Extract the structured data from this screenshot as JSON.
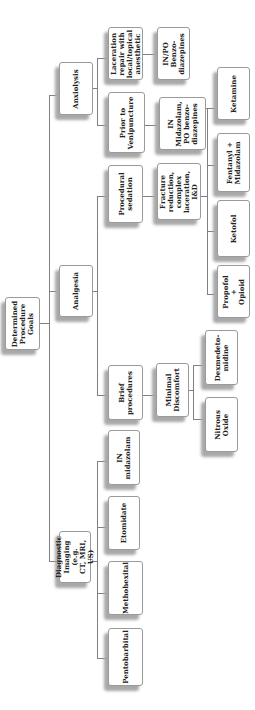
{
  "diagram": {
    "orientation": "rotated-90-counterclockwise",
    "root": {
      "label": "Determined\nProcedure\nGoals"
    },
    "goals": [
      {
        "label": "Anxiolysis",
        "situations": [
          {
            "label": "Laceration\nrepair with\nlocal/topical\nanesthetic",
            "options": [
              {
                "label": "IN/PO Benzo-\ndiazepines"
              }
            ]
          },
          {
            "label": "Prior to\nVenipuncture",
            "options": [
              {
                "label": "IN\nMidazolam,\nPO benzo-\ndiazepines"
              }
            ]
          }
        ]
      },
      {
        "label": "Analgesia",
        "situations": [
          {
            "label": "Procedural\nsedation",
            "options": [
              {
                "label": "Fracture\nreduction,\ncomplex\nlaceration,\nI&D",
                "agents": [
                  {
                    "label": "Ketamine"
                  },
                  {
                    "label": "Fentanyl +\nMidazolam"
                  },
                  {
                    "label": "Ketofol"
                  },
                  {
                    "label": "Propofol +\nOpioid"
                  }
                ]
              }
            ]
          },
          {
            "label": "Brief\nprocedures",
            "options": [
              {
                "label": "Minimal\nDiscomfort",
                "agents": [
                  {
                    "label": "Dexmedeto-\nmidine"
                  },
                  {
                    "label": "Nitrous\nOxide"
                  }
                ]
              }
            ]
          }
        ]
      },
      {
        "label": "Diagnostic\nImaging (e.g.\nCT, MRI, US)",
        "agents": [
          {
            "label": "IN\nmidazolam"
          },
          {
            "label": "Etomidate"
          },
          {
            "label": "Methohexital"
          },
          {
            "label": "Pentobarbital"
          }
        ]
      }
    ]
  },
  "colors": {
    "box_border": "#9a9a9a",
    "box_shadow": "#a8a8a8",
    "connector": "#808080",
    "text": "#222222",
    "background": "#ffffff"
  }
}
